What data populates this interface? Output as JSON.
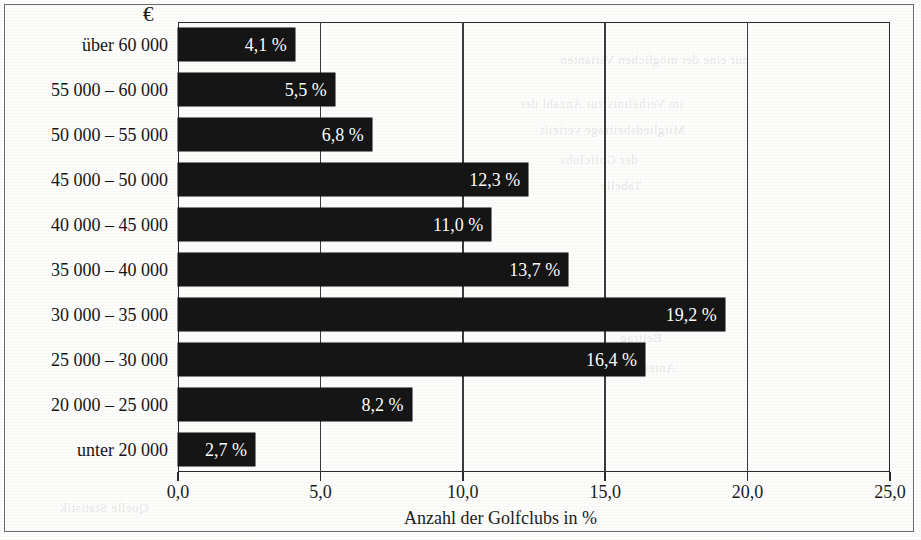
{
  "figure": {
    "unit_symbol": "€",
    "xaxis_title": "Anzahl der Golfclubs in %"
  },
  "chart_data": {
    "type": "bar",
    "orientation": "horizontal",
    "title": "",
    "subtitle": "",
    "xlabel": "Anzahl der Golfclubs in %",
    "ylabel": "€",
    "xlim": [
      0.0,
      25.0
    ],
    "xticks": [
      "0,0",
      "5,0",
      "10,0",
      "15,0",
      "20,0",
      "25,0"
    ],
    "xtick_values": [
      0.0,
      5.0,
      10.0,
      15.0,
      20.0,
      25.0
    ],
    "grid": "vertical",
    "legend": "none",
    "bar_color": "#151515",
    "categories": [
      "über 60 000",
      "55 000 – 60 000",
      "50 000 – 55 000",
      "45 000 – 50 000",
      "40 000 – 45 000",
      "35 000 – 40 000",
      "30 000 – 35 000",
      "25 000 – 30 000",
      "20 000 – 25 000",
      "unter 20 000"
    ],
    "values": [
      4.1,
      5.5,
      6.8,
      12.3,
      11.0,
      13.7,
      19.2,
      16.4,
      8.2,
      2.7
    ],
    "value_labels": [
      "4,1 %",
      "5,5 %",
      "6,8 %",
      "12,3 %",
      "11,0 %",
      "13,7 %",
      "19,2 %",
      "16,4 %",
      "8,2 %",
      "2,7 %"
    ]
  }
}
